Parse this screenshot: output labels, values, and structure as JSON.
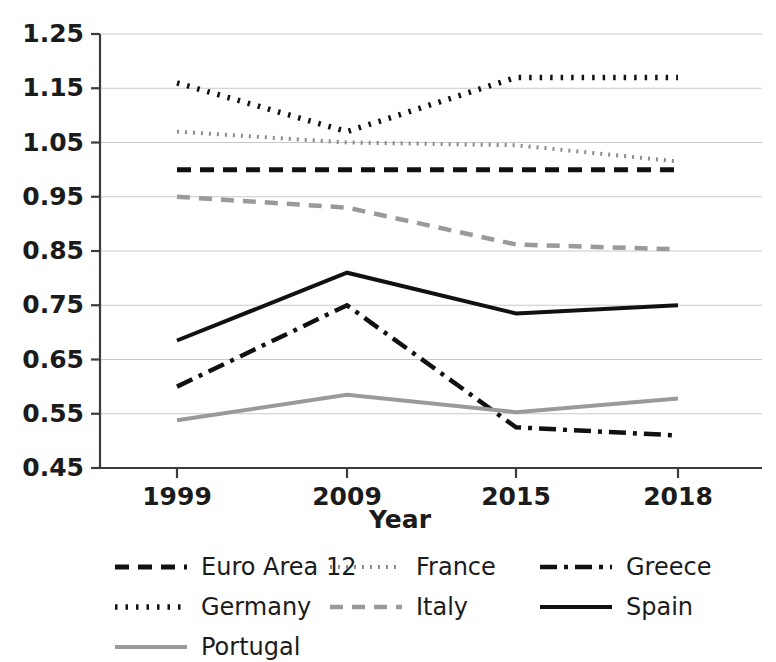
{
  "chart_data": {
    "type": "line",
    "title": "",
    "xlabel": "Year",
    "ylabel": "",
    "x": [
      1999,
      2009,
      2015,
      2018
    ],
    "categories": [
      "1999",
      "2009",
      "2015",
      "2018"
    ],
    "xtick_labels": [
      "1999",
      "2009",
      "2015",
      "2018"
    ],
    "ytick_labels": [
      "0.45",
      "0.55",
      "0.65",
      "0.75",
      "0.85",
      "0.95",
      "1.05",
      "1.15",
      "1.25"
    ],
    "ytick_values": [
      0.45,
      0.55,
      0.65,
      0.75,
      0.85,
      0.95,
      1.05,
      1.15,
      1.25
    ],
    "ylim": [
      0.45,
      1.25
    ],
    "grid": true,
    "legend_position": "below",
    "series": [
      {
        "name": "Euro Area 12",
        "values": [
          1.0,
          1.0,
          1.0,
          1.0
        ],
        "color": "#111111",
        "dash": "14,9",
        "width": 5
      },
      {
        "name": "France",
        "values": [
          1.07,
          1.05,
          1.045,
          1.015
        ],
        "color": "#8a8a8a",
        "dash": "2,6",
        "width": 4
      },
      {
        "name": "Greece",
        "values": [
          0.6,
          0.75,
          0.525,
          0.51
        ],
        "color": "#111111",
        "dash": "17,7,4,7",
        "width": 4.5
      },
      {
        "name": "Germany",
        "values": [
          1.16,
          1.07,
          1.17,
          1.17
        ],
        "color": "#111111",
        "dash": "2.5,8",
        "width": 5.5
      },
      {
        "name": "Italy",
        "values": [
          0.95,
          0.93,
          0.862,
          0.853
        ],
        "color": "#9a9a9a",
        "dash": "13,9",
        "width": 4.5
      },
      {
        "name": "Spain",
        "values": [
          0.685,
          0.81,
          0.735,
          0.75
        ],
        "color": "#111111",
        "dash": "",
        "width": 4
      },
      {
        "name": "Portugal",
        "values": [
          0.538,
          0.585,
          0.553,
          0.578
        ],
        "color": "#9a9a9a",
        "dash": "",
        "width": 4
      }
    ]
  },
  "legend": {
    "entries": [
      {
        "label": "Euro Area 12",
        "series": "Euro Area 12"
      },
      {
        "label": "France",
        "series": "France"
      },
      {
        "label": "Greece",
        "series": "Greece"
      },
      {
        "label": "Germany",
        "series": "Germany"
      },
      {
        "label": "Italy",
        "series": "Italy"
      },
      {
        "label": "Spain",
        "series": "Spain"
      },
      {
        "label": "Portugal",
        "series": "Portugal"
      }
    ]
  }
}
